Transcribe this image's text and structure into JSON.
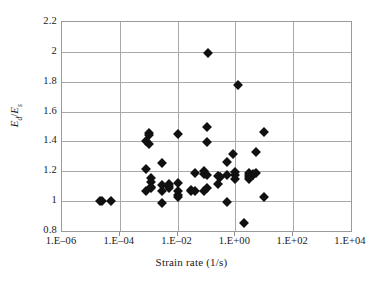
{
  "chart_data": {
    "type": "scatter",
    "title": "",
    "xlabel": "Strain rate (1/s)",
    "ylabel_html": "E_d/E_s",
    "ylabel_numerator": "E",
    "ylabel_num_sub": "d",
    "ylabel_denominator": "E",
    "ylabel_den_sub": "s",
    "x_scale": "log",
    "xlim": [
      1e-06,
      10000.0
    ],
    "ylim": [
      0.8,
      2.2
    ],
    "x_tick_labels": [
      "1.E–06",
      "1.E–04",
      "1.E–02",
      "1.E+00",
      "1.E+02",
      "1.E+04"
    ],
    "x_tick_values": [
      1e-06,
      0.0001,
      0.01,
      1,
      100,
      10000
    ],
    "y_tick_labels": [
      "2.2",
      "2",
      "1.8",
      "1.6",
      "1.4",
      "1.2",
      "1",
      "0.8"
    ],
    "y_tick_values": [
      2.2,
      2.0,
      1.8,
      1.6,
      1.4,
      1.2,
      1.0,
      0.8
    ],
    "grid": "horizontal-and-vertical",
    "legend": "none",
    "marker_style": "filled-diamond",
    "marker_color": "#111111",
    "grid_color": "#a8a8a8",
    "series": [
      {
        "name": "Ed/Es vs strain rate",
        "points": [
          [
            2.5e-05,
            1.0
          ],
          [
            5e-05,
            1.0
          ],
          [
            2e-05,
            0.998
          ],
          [
            0.0008,
            1.4
          ],
          [
            0.0008,
            1.215
          ],
          [
            0.0008,
            1.07
          ],
          [
            0.001,
            1.455
          ],
          [
            0.001,
            1.445
          ],
          [
            0.001,
            1.38
          ],
          [
            0.0012,
            1.155
          ],
          [
            0.0012,
            1.125
          ],
          [
            0.0012,
            1.095
          ],
          [
            0.0012,
            1.085
          ],
          [
            0.003,
            1.255
          ],
          [
            0.003,
            1.105
          ],
          [
            0.003,
            1.07
          ],
          [
            0.003,
            0.99
          ],
          [
            0.005,
            1.115
          ],
          [
            0.005,
            1.1
          ],
          [
            0.005,
            1.09
          ],
          [
            0.01,
            1.45
          ],
          [
            0.01,
            1.12
          ],
          [
            0.01,
            1.065
          ],
          [
            0.01,
            1.04
          ],
          [
            0.01,
            1.025
          ],
          [
            0.03,
            1.075
          ],
          [
            0.03,
            1.065
          ],
          [
            0.04,
            1.19
          ],
          [
            0.04,
            1.065
          ],
          [
            0.08,
            1.2
          ],
          [
            0.08,
            1.185
          ],
          [
            0.08,
            1.07
          ],
          [
            0.1,
            1.5
          ],
          [
            0.1,
            1.395
          ],
          [
            0.1,
            1.175
          ],
          [
            0.1,
            1.085
          ],
          [
            0.11,
            1.995
          ],
          [
            0.25,
            1.17
          ],
          [
            0.25,
            1.115
          ],
          [
            0.3,
            1.165
          ],
          [
            0.3,
            1.16
          ],
          [
            0.5,
            1.265
          ],
          [
            0.5,
            1.175
          ],
          [
            0.5,
            0.995
          ],
          [
            0.8,
            1.315
          ],
          [
            1.0,
            1.195
          ],
          [
            1.0,
            1.175
          ],
          [
            1.0,
            1.145
          ],
          [
            1.2,
            1.775
          ],
          [
            3.0,
            1.19
          ],
          [
            3.0,
            1.175
          ],
          [
            3.0,
            1.165
          ],
          [
            3.0,
            1.145
          ],
          [
            4.0,
            1.185
          ],
          [
            4.0,
            1.175
          ],
          [
            5.0,
            1.33
          ],
          [
            5.0,
            1.19
          ],
          [
            2.0,
            0.855
          ],
          [
            10.0,
            1.465
          ],
          [
            10.0,
            1.03
          ]
        ]
      }
    ]
  }
}
